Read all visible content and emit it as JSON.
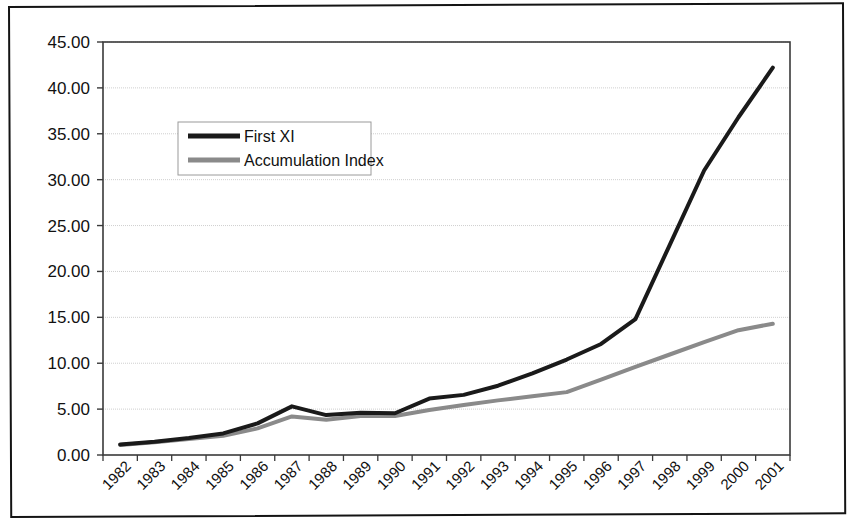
{
  "chart_data": {
    "type": "line",
    "title": "",
    "subtitle": "",
    "xlabel": "",
    "ylabel": "",
    "grid": true,
    "legend_position": "upper-left-inside",
    "ylim": [
      0,
      45
    ],
    "ytick_step": 5,
    "ytick_labels": [
      "0.00",
      "5.00",
      "10.00",
      "15.00",
      "20.00",
      "25.00",
      "30.00",
      "35.00",
      "40.00",
      "45.00"
    ],
    "ytick_values": [
      0,
      5,
      10,
      15,
      20,
      25,
      30,
      35,
      40,
      45
    ],
    "categories": [
      "1982",
      "1983",
      "1984",
      "1985",
      "1986",
      "1987",
      "1988",
      "1989",
      "1990",
      "1991",
      "1992",
      "1993",
      "1994",
      "1995",
      "1996",
      "1997",
      "1998",
      "1999",
      "2000",
      "2001"
    ],
    "xtick_label_rotation": -45,
    "series": [
      {
        "name": "First XI",
        "color": "#1a1a1a",
        "line_width": 4,
        "values": [
          1.15,
          1.45,
          1.85,
          2.35,
          3.45,
          5.3,
          4.35,
          4.6,
          4.55,
          6.15,
          6.55,
          7.55,
          8.9,
          10.4,
          12.1,
          14.8,
          22.9,
          31.0,
          36.8,
          42.2
        ]
      },
      {
        "name": "Accumulation Index",
        "color": "#8a8a8a",
        "line_width": 4,
        "values": [
          1.1,
          1.4,
          1.75,
          2.1,
          2.9,
          4.2,
          3.85,
          4.25,
          4.25,
          4.9,
          5.45,
          5.95,
          6.4,
          6.85,
          8.2,
          9.6,
          10.95,
          12.3,
          13.6,
          14.3
        ]
      }
    ]
  },
  "legend": {
    "entries": [
      {
        "label": "First XI"
      },
      {
        "label": "Accumulation Index"
      }
    ]
  },
  "axes": {
    "y_axis_name": "value-axis",
    "x_axis_name": "year-axis"
  }
}
